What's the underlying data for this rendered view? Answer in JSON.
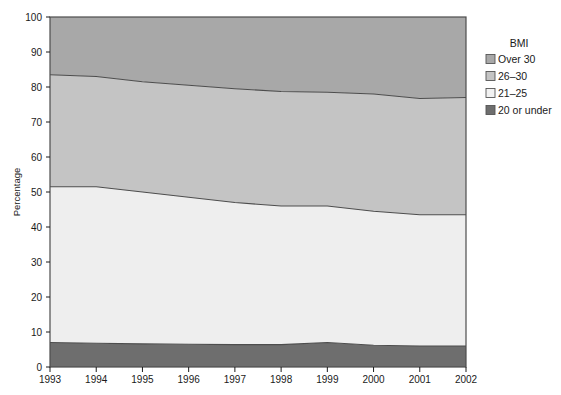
{
  "chart_data": {
    "type": "area",
    "stacked": true,
    "title": "",
    "xlabel": "",
    "ylabel": "Percentage",
    "categories": [
      "1993",
      "1994",
      "1995",
      "1996",
      "1997",
      "1998",
      "1999",
      "2000",
      "2001",
      "2002"
    ],
    "x": [
      1993,
      1994,
      1995,
      1996,
      1997,
      1998,
      1999,
      2000,
      2001,
      2002
    ],
    "xlim": [
      1993,
      2002
    ],
    "ylim": [
      0,
      100
    ],
    "yticks": [
      0,
      10,
      20,
      30,
      40,
      50,
      60,
      70,
      80,
      90,
      100
    ],
    "ytick_labels": [
      "0",
      "10",
      "20",
      "30",
      "40",
      "50",
      "60",
      "70",
      "80",
      "90",
      "100"
    ],
    "grid": false,
    "legend_position": "right",
    "legend_title": "BMI",
    "stack_order_bottom_to_top": [
      "20 or under",
      "21-25",
      "26-30",
      "Over 30"
    ],
    "series": [
      {
        "name": "20 or under",
        "color": "#6e6e6e",
        "values": [
          7.0,
          6.8,
          6.6,
          6.5,
          6.4,
          6.4,
          7.0,
          6.2,
          6.0,
          6.0
        ],
        "cumulative": [
          7.0,
          6.8,
          6.6,
          6.5,
          6.4,
          6.4,
          7.0,
          6.2,
          6.0,
          6.0
        ]
      },
      {
        "name": "21-25",
        "color": "#eeeeee",
        "values": [
          44.5,
          44.7,
          43.4,
          42.0,
          40.6,
          39.6,
          39.0,
          38.3,
          37.5,
          37.5
        ],
        "cumulative": [
          51.5,
          51.5,
          50.0,
          48.5,
          47.0,
          46.0,
          46.0,
          44.5,
          43.5,
          43.5
        ]
      },
      {
        "name": "26-30",
        "color": "#c4c4c4",
        "values": [
          32.0,
          31.5,
          31.5,
          32.0,
          32.5,
          32.7,
          32.5,
          33.5,
          33.2,
          33.5
        ],
        "cumulative": [
          83.5,
          83.0,
          81.5,
          80.5,
          79.5,
          78.7,
          78.5,
          78.0,
          76.7,
          77.0
        ]
      },
      {
        "name": "Over 30",
        "color": "#a8a8a8",
        "values": [
          16.5,
          17.0,
          18.5,
          19.5,
          20.5,
          21.3,
          21.5,
          22.0,
          23.3,
          23.0
        ],
        "cumulative": [
          100,
          100,
          100,
          100,
          100,
          100,
          100,
          100,
          100,
          100
        ]
      }
    ],
    "legend_entries": [
      {
        "label": "Over 30",
        "color": "#a8a8a8"
      },
      {
        "label": "26–30",
        "color": "#c4c4c4"
      },
      {
        "label": "21–25",
        "color": "#f2f2f2"
      },
      {
        "label": "20 or under",
        "color": "#6e6e6e"
      }
    ]
  },
  "axes": {
    "y_axis_label": "Percentage"
  },
  "legend": {
    "title": "BMI"
  }
}
